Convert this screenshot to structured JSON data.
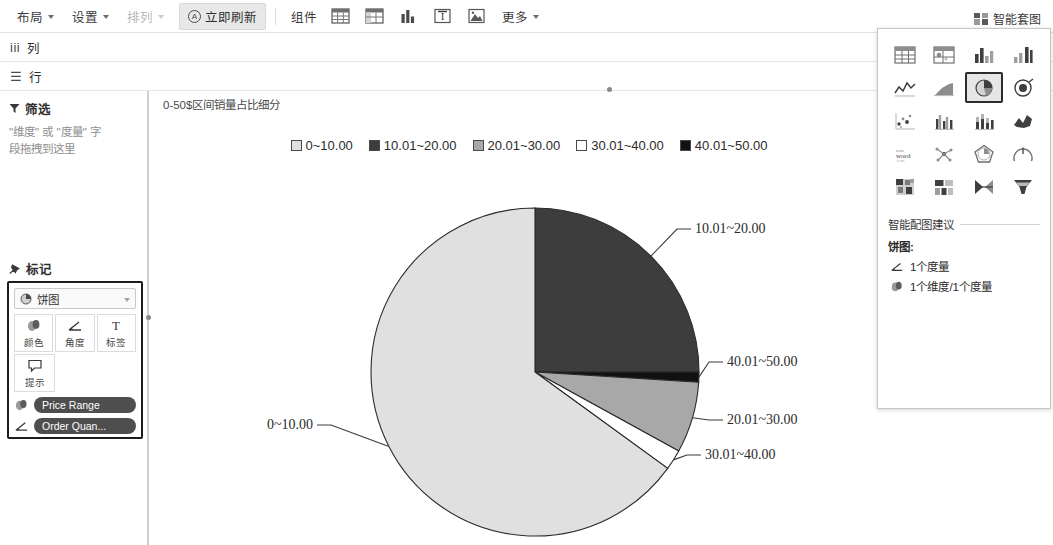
{
  "toolbar": {
    "layout": "布局",
    "settings": "设置",
    "arrange": "排列",
    "refresh": "立即刷新",
    "components_label": "组件",
    "more": "更多",
    "component_icons": [
      {
        "name": "table-icon"
      },
      {
        "name": "crosstab-icon"
      },
      {
        "name": "bar-chart-icon"
      },
      {
        "name": "text-box-icon"
      },
      {
        "name": "image-icon"
      }
    ],
    "show_me_button": "智能套图"
  },
  "shelves": {
    "columns_label": "列",
    "rows_label": "行"
  },
  "left_panel": {
    "filter_title": "筛选",
    "filter_hint_line1": "\"维度\" 或 \"度量\" 字",
    "filter_hint_line2": "段拖拽到这里",
    "marks_title": "标记",
    "mark_type": "饼图",
    "mark_buttons": [
      {
        "label": "颜色",
        "icon": "color-icon"
      },
      {
        "label": "角度",
        "icon": "angle-icon"
      },
      {
        "label": "标签",
        "icon": "label-icon"
      },
      {
        "label": "提示",
        "icon": "tooltip-icon"
      }
    ],
    "pills": [
      {
        "label": "Price Range",
        "icon": "color-icon"
      },
      {
        "label": "Order Quan...",
        "icon": "angle-icon"
      }
    ]
  },
  "viz": {
    "title": "0-50$区间销量占比细分"
  },
  "show_me": {
    "suggestion_title": "智能配图建议",
    "chart_kind": "饼图:",
    "requirements": [
      {
        "icon": "angle-icon",
        "text": "1个度量"
      },
      {
        "icon": "color-icon",
        "text": "1个维度/1个度量"
      }
    ],
    "chart_types": [
      {
        "name": "text-table-icon",
        "selected": false
      },
      {
        "name": "heat-map-icon",
        "selected": false
      },
      {
        "name": "highlight-table-icon",
        "selected": false
      },
      {
        "name": "symbol-map-icon",
        "selected": false
      },
      {
        "name": "line-chart-icon",
        "selected": false
      },
      {
        "name": "area-chart-icon",
        "selected": false
      },
      {
        "name": "pie-chart-icon",
        "selected": true
      },
      {
        "name": "filled-map-icon",
        "selected": false
      },
      {
        "name": "scatter-plot-icon",
        "selected": false
      },
      {
        "name": "side-by-side-bar-icon",
        "selected": false
      },
      {
        "name": "stacked-bar-icon",
        "selected": false
      },
      {
        "name": "dual-line-icon",
        "selected": false
      },
      {
        "name": "word-cloud-icon",
        "selected": false
      },
      {
        "name": "network-icon",
        "selected": false
      },
      {
        "name": "polygon-icon",
        "selected": false
      },
      {
        "name": "gauge-icon",
        "selected": false
      },
      {
        "name": "treemap-icon",
        "selected": false
      },
      {
        "name": "box-grid-icon",
        "selected": false
      },
      {
        "name": "bowtie-icon",
        "selected": false
      },
      {
        "name": "funnel-icon",
        "selected": false
      }
    ]
  },
  "chart_data": {
    "type": "pie",
    "title": "0-50$区间销量占比细分",
    "legend_position": "top",
    "categories": [
      "0~10.00",
      "10.01~20.00",
      "20.01~30.00",
      "30.01~40.00",
      "40.01~50.00"
    ],
    "values": [
      65.0,
      25.0,
      7.0,
      2.0,
      1.0
    ],
    "angles_deg": [
      234.0,
      90.0,
      25.2,
      7.2,
      3.6
    ],
    "colors": [
      "#e0e0e0",
      "#3d3d3d",
      "#a8a8a8",
      "#ffffff",
      "#111111"
    ],
    "labels": [
      "0~10.00",
      "10.01~20.00",
      "20.01~30.00",
      "30.01~40.00",
      "40.01~50.00"
    ],
    "xlabel": "",
    "ylabel": "",
    "grid": false
  }
}
